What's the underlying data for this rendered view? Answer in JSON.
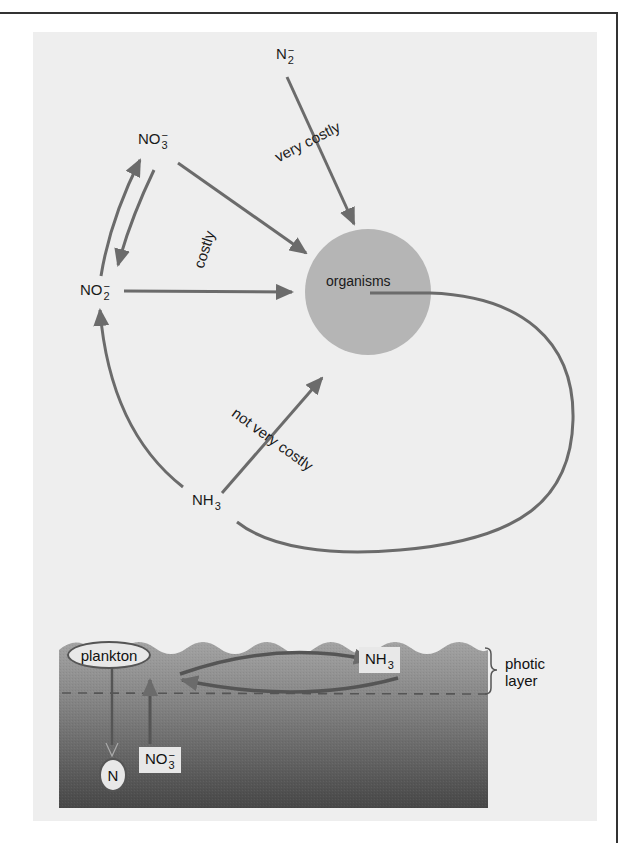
{
  "top_diagram": {
    "center_node": "organisms",
    "nodes": {
      "n2": {
        "base": "N",
        "sub": "2",
        "sup": "−"
      },
      "no3": {
        "base": "NO",
        "sub": "3",
        "sup": "−"
      },
      "no2": {
        "base": "NO",
        "sub": "2",
        "sup": "−"
      },
      "nh3": {
        "base": "NH",
        "sub": "3"
      }
    },
    "edge_labels": {
      "n2_to_organisms": "very costly",
      "no3_no2_to_organisms": "costly",
      "nh3_to_organisms": "not very costly"
    }
  },
  "ocean_diagram": {
    "plankton": "plankton",
    "nh3": {
      "base": "NH",
      "sub": "3"
    },
    "no3": {
      "base": "NO",
      "sub": "3",
      "sup": "−"
    },
    "sink_node": "N",
    "photic_layer_label": [
      "photic",
      "layer"
    ]
  },
  "colors": {
    "arrow": "#6b6b6b",
    "organisms_fill": "#b5b5b5",
    "panel_bg": "#eeeeee",
    "ocean_top": "#9a9a9a",
    "ocean_bottom": "#4a4a4a"
  }
}
